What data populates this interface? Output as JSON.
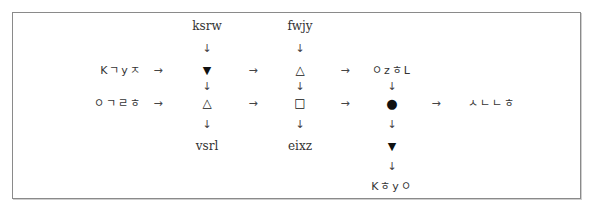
{
  "diagram": {
    "type": "symbol-transformation-puzzle",
    "inputs": {
      "top_col1": "ksrw",
      "top_col2": "fwjy",
      "row1_left": "Kㄱyㅈ",
      "row2_left": "ㅇㄱㄹㅎ",
      "row1_col3": "ㅇzㅎL"
    },
    "outputs": {
      "bottom_col1": "vsrl",
      "bottom_col2": "eixz",
      "row2_right": "ㅅㄴㄴㅎ",
      "bottom_col3": "Kㅎyㅇ"
    },
    "symbols": {
      "r1c1": "▼",
      "r1c2": "△",
      "r2c1": "△",
      "r2c2": "□",
      "r2c3": "●",
      "r3c3": "▼"
    },
    "arrows": {
      "right": "→",
      "down": "↓"
    }
  }
}
